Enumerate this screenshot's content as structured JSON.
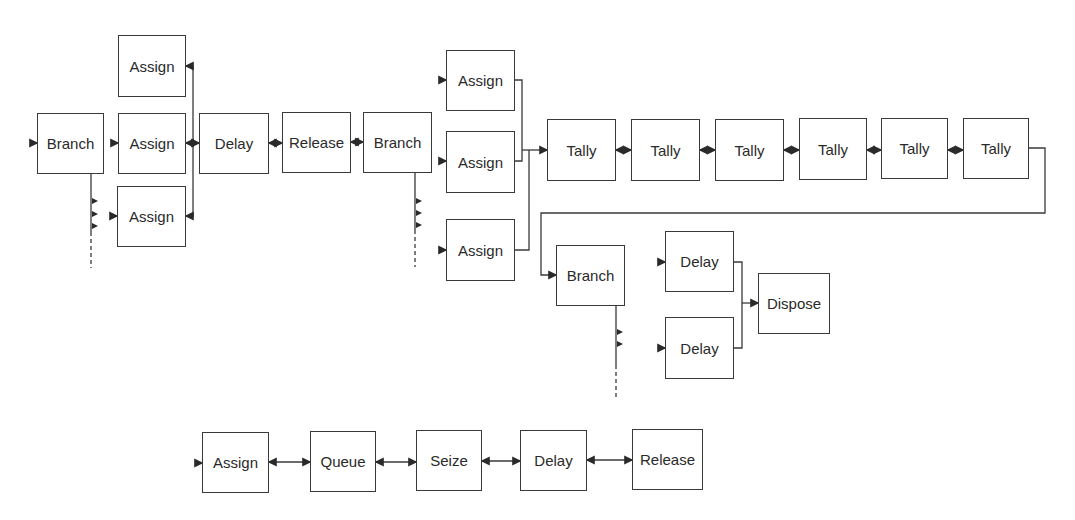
{
  "diagram": {
    "colors": {
      "stroke": "#3a3a3a",
      "text": "#2a2a2a",
      "background": "#ffffff"
    },
    "row1": {
      "branch": {
        "label": "Branch"
      },
      "assign_top": {
        "label": "Assign"
      },
      "assign_mid": {
        "label": "Assign"
      },
      "assign_bot": {
        "label": "Assign"
      },
      "delay": {
        "label": "Delay"
      },
      "release": {
        "label": "Release"
      },
      "branch2": {
        "label": "Branch"
      },
      "assign_a": {
        "label": "Assign"
      },
      "assign_b": {
        "label": "Assign"
      },
      "assign_c": {
        "label": "Assign"
      },
      "tallies": [
        {
          "label": "Tally"
        },
        {
          "label": "Tally"
        },
        {
          "label": "Tally"
        },
        {
          "label": "Tally"
        },
        {
          "label": "Tally"
        },
        {
          "label": "Tally"
        }
      ]
    },
    "row2": {
      "branch3": {
        "label": "Branch"
      },
      "delay_top": {
        "label": "Delay"
      },
      "delay_bot": {
        "label": "Delay"
      },
      "dispose": {
        "label": "Dispose"
      }
    },
    "row3": {
      "blocks": [
        {
          "label": "Assign"
        },
        {
          "label": "Queue"
        },
        {
          "label": "Seize"
        },
        {
          "label": "Delay"
        },
        {
          "label": "Release"
        }
      ]
    }
  }
}
